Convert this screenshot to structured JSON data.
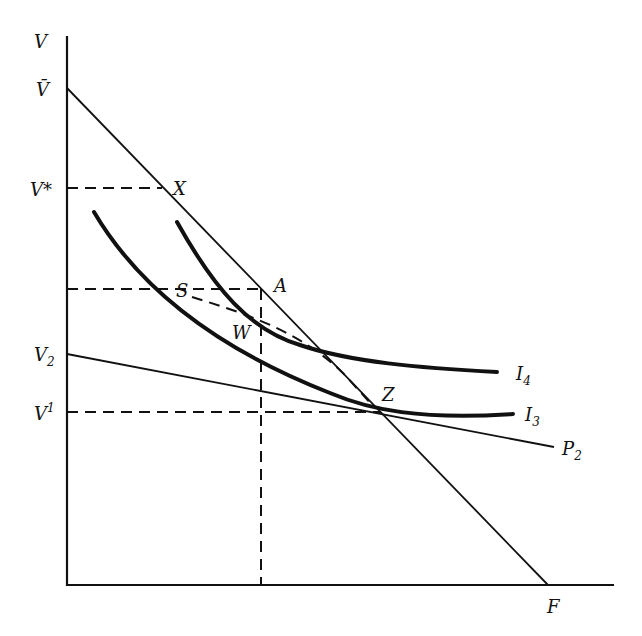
{
  "diagram": {
    "axes": {
      "y_label": "V",
      "x_label": "F"
    },
    "y_ticks": [
      {
        "id": "vbar",
        "label": "V̄"
      },
      {
        "id": "vstar",
        "label": "V*"
      },
      {
        "id": "v2",
        "label": "V",
        "sub": "2"
      },
      {
        "id": "v1",
        "label": "V",
        "sup": "1"
      }
    ],
    "points": [
      {
        "id": "X",
        "label": "X"
      },
      {
        "id": "A",
        "label": "A"
      },
      {
        "id": "S",
        "label": "S"
      },
      {
        "id": "W",
        "label": "W"
      },
      {
        "id": "Z",
        "label": "Z"
      }
    ],
    "curves": [
      {
        "id": "I4",
        "label": "I",
        "sub": "4",
        "type": "indifference-curve"
      },
      {
        "id": "I3",
        "label": "I",
        "sub": "3",
        "type": "indifference-curve"
      },
      {
        "id": "P2",
        "label": "P",
        "sub": "2",
        "type": "price-line"
      },
      {
        "id": "budget",
        "label": "",
        "type": "budget-line from V̄ to F"
      }
    ],
    "colors": {
      "ink": "#111111",
      "background": "#ffffff"
    }
  }
}
